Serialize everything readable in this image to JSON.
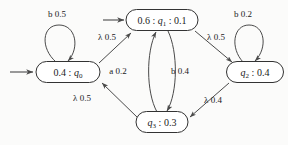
{
  "diagram": {
    "type": "finite-state-automaton",
    "title": "",
    "canvas": {
      "width": 288,
      "height": 145
    },
    "colors": {
      "background": "#fbfbfa",
      "node_fill": "#ffffff",
      "node_stroke": "#333333",
      "edge_stroke": "#4a4a4a",
      "text": "#1a1a1a"
    },
    "nodes": [
      {
        "id": "q0",
        "name": "state-q0",
        "label_plain": "0.4 : q0",
        "label_prefix": "0.4 : ",
        "label_var": "q",
        "label_sub": "0",
        "label_suffix": "",
        "x": 68,
        "y": 72,
        "w": 64,
        "h": 21,
        "initial": true
      },
      {
        "id": "q1",
        "name": "state-q1",
        "label_plain": "0.6 : q1 : 0.1",
        "label_prefix": "0.6 : ",
        "label_var": "q",
        "label_sub": "1",
        "label_suffix": " : 0.1",
        "x": 162,
        "y": 20,
        "w": 72,
        "h": 21,
        "initial": true
      },
      {
        "id": "q2",
        "name": "state-q2",
        "label_plain": "q2 : 0.4",
        "label_prefix": "",
        "label_var": "q",
        "label_sub": "2",
        "label_suffix": " : 0.4",
        "x": 255,
        "y": 72,
        "w": 57,
        "h": 21,
        "initial": false
      },
      {
        "id": "q3",
        "name": "state-q3",
        "label_plain": "q3 : 0.3",
        "label_prefix": "",
        "label_var": "q",
        "label_sub": "3",
        "label_suffix": " : 0.3",
        "x": 162,
        "y": 122,
        "w": 52,
        "h": 21,
        "initial": false
      }
    ],
    "edges": [
      {
        "name": "edge-q0-self-loop",
        "from": "q0",
        "to": "q0",
        "symbol": "b",
        "weight": "0.5",
        "label": "b 0.5",
        "label_x": 57,
        "label_y": 17
      },
      {
        "name": "edge-q0-to-q1",
        "from": "q0",
        "to": "q1",
        "symbol": "λ",
        "weight": "0.5",
        "label": "λ 0.5",
        "label_x": 107,
        "label_y": 40
      },
      {
        "name": "edge-q1-to-q2",
        "from": "q1",
        "to": "q2",
        "symbol": "λ",
        "weight": "0.5",
        "label": "λ 0.5",
        "label_x": 216,
        "label_y": 40
      },
      {
        "name": "edge-q2-self-loop",
        "from": "q2",
        "to": "q2",
        "symbol": "b",
        "weight": "0.2",
        "label": "b 0.2",
        "label_x": 243,
        "label_y": 17
      },
      {
        "name": "edge-q3-to-q0",
        "from": "q3",
        "to": "q0",
        "symbol": "λ",
        "weight": "0.5",
        "label": "λ 0.5",
        "label_x": 82,
        "label_y": 101
      },
      {
        "name": "edge-q3-to-q1",
        "from": "q3",
        "to": "q1",
        "symbol": "a",
        "weight": "0.2",
        "label": "a 0.2",
        "label_x": 118,
        "label_y": 74
      },
      {
        "name": "edge-q1-to-q3",
        "from": "q1",
        "to": "q3",
        "symbol": "b",
        "weight": "0.4",
        "label": "b 0.4",
        "label_x": 180,
        "label_y": 74
      },
      {
        "name": "edge-q2-to-q3",
        "from": "q2",
        "to": "q3",
        "symbol": "λ",
        "weight": "0.4",
        "label": "λ 0.4",
        "label_x": 213,
        "label_y": 103
      }
    ],
    "start_arrows": [
      {
        "name": "start-arrow-q0",
        "target": "q0"
      },
      {
        "name": "start-arrow-q1",
        "target": "q1"
      }
    ]
  }
}
